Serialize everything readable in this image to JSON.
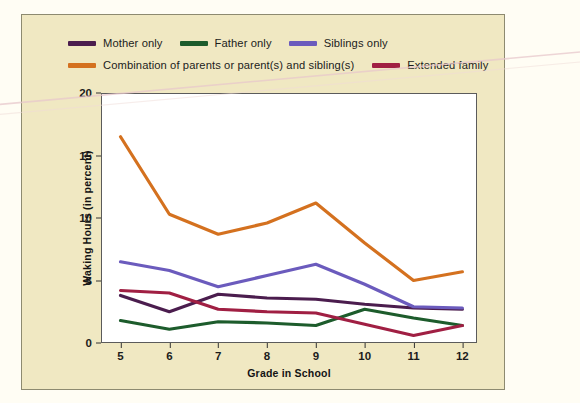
{
  "figure": {
    "background_color": "#f0e8c2",
    "plot_background_color": "#ffffff"
  },
  "legend": {
    "position": "top",
    "items": [
      {
        "label": "Mother only",
        "color": "#4b1d4e"
      },
      {
        "label": "Father only",
        "color": "#1d5c2c"
      },
      {
        "label": "Siblings only",
        "color": "#6b5bbd"
      },
      {
        "label": "Combination of parents or parent(s) and sibling(s)",
        "color": "#d4711f"
      },
      {
        "label": "Extended family",
        "color": "#a01f43"
      }
    ]
  },
  "chart_data": {
    "type": "line",
    "title": "",
    "xlabel": "Grade in School",
    "ylabel": "Waking Hours (in percent)",
    "x": [
      5,
      6,
      7,
      8,
      9,
      10,
      11,
      12
    ],
    "categories": [
      "5",
      "6",
      "7",
      "8",
      "9",
      "10",
      "11",
      "12"
    ],
    "xlim": [
      4.6,
      12.3
    ],
    "ylim": [
      0,
      20
    ],
    "yticks": [
      0,
      5,
      10,
      15,
      20
    ],
    "xticks": [
      5,
      6,
      7,
      8,
      9,
      10,
      11,
      12
    ],
    "grid": false,
    "series": [
      {
        "name": "Mother only",
        "color": "#4b1d4e",
        "values": [
          3.8,
          2.5,
          3.9,
          3.6,
          3.5,
          3.1,
          2.8,
          2.7
        ]
      },
      {
        "name": "Father only",
        "color": "#1d5c2c",
        "values": [
          1.8,
          1.1,
          1.7,
          1.6,
          1.4,
          2.7,
          2.0,
          1.4
        ]
      },
      {
        "name": "Siblings only",
        "color": "#6b5bbd",
        "values": [
          6.5,
          5.8,
          4.5,
          5.4,
          6.3,
          4.7,
          2.9,
          2.8
        ]
      },
      {
        "name": "Combination of parents or parent(s) and sibling(s)",
        "color": "#d4711f",
        "values": [
          16.5,
          10.3,
          8.7,
          9.6,
          11.2,
          8.0,
          5.0,
          5.7
        ]
      },
      {
        "name": "Extended family",
        "color": "#a01f43",
        "values": [
          4.2,
          4.0,
          2.7,
          2.5,
          2.4,
          1.5,
          0.6,
          1.4
        ]
      }
    ]
  }
}
